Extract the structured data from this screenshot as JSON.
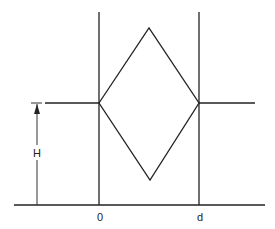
{
  "diagram": {
    "type": "geometric schematic",
    "labels": {
      "left_boundary": "0",
      "right_boundary": "d",
      "height": "H"
    },
    "elements": {
      "left_vertical_line": {
        "x": 99,
        "y1": 12,
        "y2": 205
      },
      "right_vertical_line": {
        "x": 199,
        "y1": 12,
        "y2": 205
      },
      "baseline": {
        "y": 205,
        "x1": 14,
        "x2": 265
      },
      "left_horizontal_segment": {
        "y": 103,
        "x1": 45,
        "x2": 99
      },
      "right_horizontal_segment": {
        "y": 103,
        "x1": 199,
        "x2": 255
      },
      "rhombus": {
        "left": [
          99,
          103
        ],
        "top": [
          149,
          28
        ],
        "right": [
          199,
          103
        ],
        "bottom": [
          150,
          180
        ]
      },
      "height_dimension": {
        "x": 37,
        "y_top": 103,
        "y_bottom": 205,
        "arrow": "up"
      }
    },
    "colors": {
      "line": "#222222",
      "background": "#ffffff"
    }
  }
}
